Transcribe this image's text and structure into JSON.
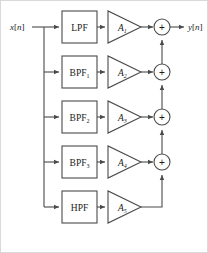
{
  "diagram": {
    "input_label": "x[n]",
    "output_label": "y[n]",
    "adder_symbol": "+",
    "colors": {
      "stroke": "#4a4a4a",
      "text": "#1a1a1a",
      "background": "#ffffff",
      "frame": "#d9d9d9"
    },
    "branches": [
      {
        "filter_base": "LPF",
        "filter_subscript": "",
        "amp_base": "A",
        "amp_subscript": "1"
      },
      {
        "filter_base": "BPF",
        "filter_subscript": "1",
        "amp_base": "A",
        "amp_subscript": "2"
      },
      {
        "filter_base": "BPF",
        "filter_subscript": "2",
        "amp_base": "A",
        "amp_subscript": "3"
      },
      {
        "filter_base": "BPF",
        "filter_subscript": "3",
        "amp_base": "A",
        "amp_subscript": "4"
      },
      {
        "filter_base": "HPF",
        "filter_subscript": "",
        "amp_base": "A",
        "amp_subscript": "5"
      }
    ],
    "adders": [
      {
        "symbol": "+"
      },
      {
        "symbol": "+"
      },
      {
        "symbol": "+"
      },
      {
        "symbol": "+"
      }
    ]
  }
}
